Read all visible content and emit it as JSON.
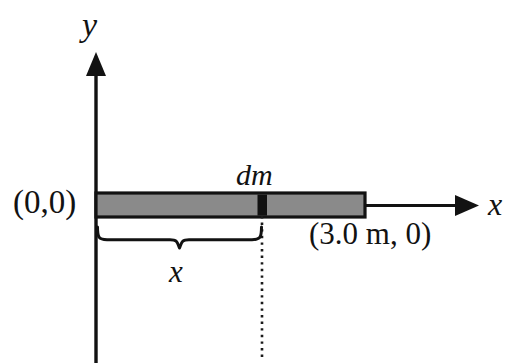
{
  "figure": {
    "background_color": "#ffffff",
    "stroke_color": "#121212",
    "bar_fill_color": "#8a8a8a",
    "dm_fill_color": "#111111"
  },
  "axes": {
    "y_label": "y",
    "x_label": "x",
    "origin_label": "(0,0)",
    "y_axis": {
      "x": 96,
      "top": 55,
      "bottom": 363
    },
    "x_axis": {
      "y": 205,
      "left": 96,
      "right": 478
    }
  },
  "rod": {
    "start_label": "(0,0)",
    "end_label": "(3.0 m, 0)",
    "length_value": "3.0",
    "length_unit": "m",
    "left_px": 96,
    "right_px": 365,
    "top_px": 193,
    "bottom_px": 217
  },
  "mass_element": {
    "label": "dm",
    "left_px": 258,
    "right_px": 267
  },
  "distance_marker": {
    "label": "x",
    "brace_left_px": 96,
    "brace_right_px": 262,
    "brace_y_px": 240
  },
  "dotted_guide": {
    "x_px": 262,
    "top_px": 217,
    "bottom_px": 357
  }
}
